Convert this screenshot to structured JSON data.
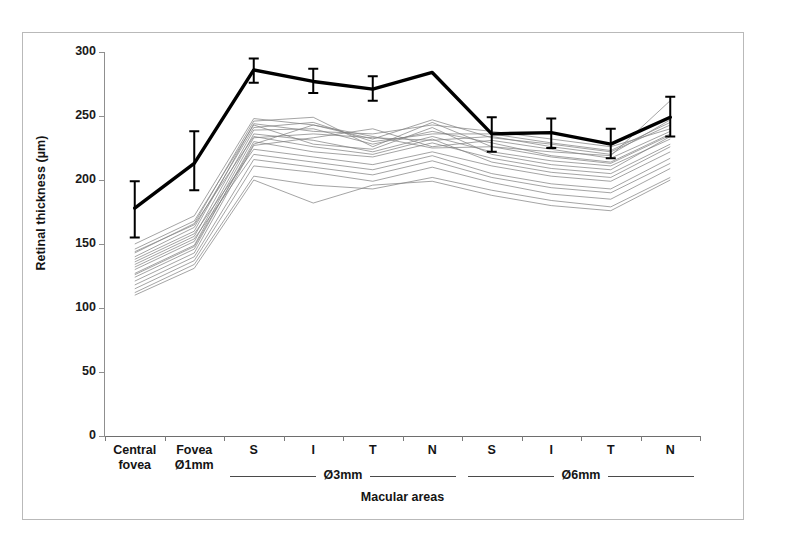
{
  "chart_data": {
    "type": "line",
    "title": "",
    "xlabel": "Macular areas",
    "ylabel": "Retinal thickness (µm)",
    "ylim": [
      0,
      300
    ],
    "yticks": [
      0,
      50,
      100,
      150,
      200,
      250,
      300
    ],
    "grid": false,
    "legend": "none",
    "categories": [
      "Central fovea",
      "Fovea Ø1mm",
      "S",
      "I",
      "T",
      "N",
      "S",
      "I",
      "T",
      "N"
    ],
    "category_lines": [
      [
        "Central",
        "fovea"
      ],
      [
        "Fovea",
        "Ø1mm"
      ],
      [
        "S",
        ""
      ],
      [
        "I",
        ""
      ],
      [
        "T",
        ""
      ],
      [
        "N",
        ""
      ],
      [
        "S",
        ""
      ],
      [
        "I",
        ""
      ],
      [
        "T",
        ""
      ],
      [
        "N",
        ""
      ]
    ],
    "groups": [
      {
        "label": "Ø3mm",
        "from": 2,
        "to": 5
      },
      {
        "label": "Ø6mm",
        "from": 6,
        "to": 9
      }
    ],
    "series": [
      {
        "name": "Mean retinal thickness",
        "style": "bold-line-with-error-bars",
        "color": "#000000",
        "values": [
          178,
          213,
          286,
          277,
          271,
          284,
          236,
          237,
          228,
          249
        ],
        "error_upper": [
          199,
          238,
          295,
          287,
          281,
          284,
          249,
          248,
          240,
          265
        ],
        "error_lower": [
          155,
          192,
          276,
          268,
          262,
          284,
          222,
          225,
          217,
          234
        ]
      },
      {
        "name": "subject-01",
        "style": "thin-line",
        "color": "#808080",
        "values": [
          150,
          172,
          248,
          243,
          232,
          247,
          233,
          228,
          222,
          243
        ]
      },
      {
        "name": "subject-02",
        "style": "thin-line",
        "color": "#808080",
        "values": [
          143,
          166,
          246,
          249,
          226,
          245,
          226,
          222,
          219,
          262
        ]
      },
      {
        "name": "subject-03",
        "style": "thin-line",
        "color": "#808080",
        "values": [
          138,
          160,
          244,
          238,
          236,
          243,
          238,
          232,
          226,
          240
        ]
      },
      {
        "name": "subject-04",
        "style": "thin-line",
        "color": "#808080",
        "values": [
          134,
          156,
          239,
          240,
          228,
          238,
          229,
          219,
          214,
          236
        ]
      },
      {
        "name": "subject-05",
        "style": "thin-line",
        "color": "#808080",
        "values": [
          130,
          152,
          236,
          231,
          222,
          234,
          222,
          215,
          211,
          232
        ]
      },
      {
        "name": "subject-06",
        "style": "thin-line",
        "color": "#808080",
        "values": [
          127,
          149,
          233,
          236,
          233,
          231,
          234,
          226,
          220,
          247
        ]
      },
      {
        "name": "subject-07",
        "style": "thin-line",
        "color": "#808080",
        "values": [
          124,
          146,
          230,
          222,
          218,
          229,
          217,
          209,
          205,
          228
        ]
      },
      {
        "name": "subject-08",
        "style": "thin-line",
        "color": "#808080",
        "values": [
          121,
          143,
          227,
          233,
          240,
          226,
          231,
          224,
          217,
          238
        ]
      },
      {
        "name": "subject-09",
        "style": "thin-line",
        "color": "#808080",
        "values": [
          146,
          168,
          243,
          228,
          224,
          241,
          220,
          212,
          208,
          234
        ]
      },
      {
        "name": "subject-10",
        "style": "thin-line",
        "color": "#808080",
        "values": [
          140,
          163,
          241,
          245,
          230,
          236,
          236,
          229,
          223,
          245
        ]
      },
      {
        "name": "subject-11",
        "style": "thin-line",
        "color": "#808080",
        "values": [
          136,
          158,
          224,
          218,
          212,
          222,
          211,
          203,
          199,
          222
        ]
      },
      {
        "name": "subject-12",
        "style": "thin-line",
        "color": "#808080",
        "values": [
          132,
          154,
          220,
          214,
          208,
          219,
          205,
          197,
          193,
          217
        ]
      },
      {
        "name": "subject-13",
        "style": "thin-line",
        "color": "#808080",
        "values": [
          118,
          140,
          216,
          210,
          204,
          215,
          202,
          194,
          190,
          213
        ]
      },
      {
        "name": "subject-14",
        "style": "thin-line",
        "color": "#808080",
        "values": [
          115,
          137,
          211,
          206,
          199,
          210,
          198,
          189,
          185,
          209
        ]
      },
      {
        "name": "subject-15",
        "style": "thin-line",
        "color": "#808080",
        "values": [
          112,
          134,
          203,
          196,
          193,
          202,
          192,
          184,
          179,
          202
        ]
      },
      {
        "name": "subject-16",
        "style": "thin-line",
        "color": "#808080",
        "values": [
          110,
          131,
          200,
          182,
          196,
          199,
          188,
          180,
          176,
          200
        ]
      },
      {
        "name": "subject-17",
        "style": "thin-line",
        "color": "#808080",
        "values": [
          126,
          148,
          228,
          243,
          234,
          225,
          226,
          218,
          213,
          235
        ]
      },
      {
        "name": "subject-18",
        "style": "thin-line",
        "color": "#808080",
        "values": [
          144,
          165,
          234,
          226,
          220,
          232,
          214,
          206,
          202,
          226
        ]
      }
    ]
  },
  "axes": {
    "y_title": "Retinal thickness (µm)",
    "x_title": "Macular areas",
    "y_tick_labels": [
      "300",
      "250",
      "200",
      "150",
      "100",
      "50",
      "0"
    ]
  }
}
